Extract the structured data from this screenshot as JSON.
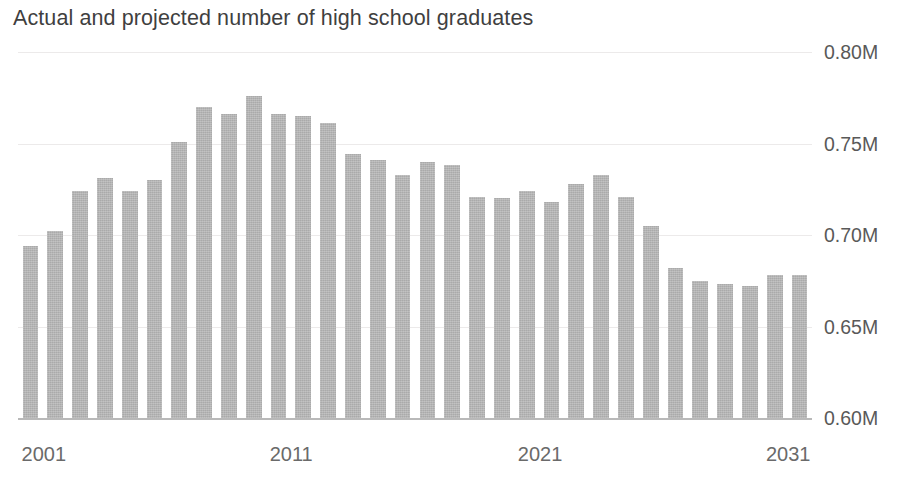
{
  "chart_data": {
    "type": "bar",
    "title": "Actual and projected number of high school graduates",
    "xlabel": "",
    "ylabel": "",
    "ylim": [
      0.6,
      0.8
    ],
    "grid": true,
    "legend": null,
    "yticks": [
      0.8,
      0.75,
      0.7,
      0.65,
      0.6
    ],
    "ytick_labels": [
      "0.80M",
      "0.75M",
      "0.70M",
      "0.65M",
      "0.60M"
    ],
    "xtick_labels": [
      "2001",
      "2011",
      "2021",
      "2031"
    ],
    "xtick_categories": [
      "2001",
      "2011",
      "2021",
      "2031"
    ],
    "bar_color": "#b2b2b2",
    "gridline_color": "#eceaea",
    "axis_color": "#b9b9b9",
    "categories": [
      "2001",
      "2002",
      "2003",
      "2004",
      "2005",
      "2006",
      "2007",
      "2008",
      "2009",
      "2010",
      "2011",
      "2012",
      "2013",
      "2014",
      "2015",
      "2016",
      "2017",
      "2018",
      "2019",
      "2020",
      "2021",
      "2022",
      "2023",
      "2024",
      "2025",
      "2026",
      "2027",
      "2028",
      "2029",
      "2030",
      "2031",
      "2032"
    ],
    "values": [
      0.694,
      0.702,
      0.724,
      0.731,
      0.724,
      0.73,
      0.751,
      0.77,
      0.766,
      0.776,
      0.766,
      0.765,
      0.761,
      0.744,
      0.741,
      0.733,
      0.74,
      0.738,
      0.721,
      0.72,
      0.724,
      0.718,
      0.728,
      0.733,
      0.721,
      0.705,
      0.682,
      0.675,
      0.673,
      0.672,
      0.678,
      0.678
    ]
  }
}
